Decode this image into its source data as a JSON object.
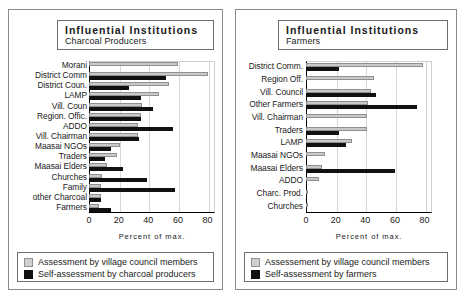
{
  "figure": {
    "background": "#ffffff",
    "series_colors": {
      "grey": "#c9c9c9",
      "black": "#111111"
    }
  },
  "panels": [
    {
      "id": "charcoal-producers",
      "title_main": "Influential Institutions",
      "title_sub": "Charcoal Producers",
      "xlabel": "Percent of max.",
      "xticks": [
        "0",
        "20",
        "40",
        "60",
        "80"
      ],
      "legend": [
        {
          "swatch": "grey",
          "label": "Assessment by village council members"
        },
        {
          "swatch": "black",
          "label": "Self-assessment by charcoal producers"
        }
      ],
      "chart_data": {
        "type": "bar",
        "orientation": "horizontal",
        "title": "Influential Institutions — Charcoal Producers",
        "xlabel": "Percent of max.",
        "ylabel": "",
        "xlim": [
          0,
          85
        ],
        "xticks": [
          0,
          20,
          40,
          60,
          80
        ],
        "grid": "vertical",
        "legend_position": "below-axes",
        "categories": [
          "Morani",
          "District Comm",
          "District Coun.",
          "LAMP",
          "Vill. Coun",
          "Region. Offic.",
          "ADDO",
          "Vill. Chairman",
          "Maasai NGOs",
          "Traders",
          "Maasai Elders",
          "Churches",
          "Family",
          "other Charcoal",
          "Farmers"
        ],
        "series": [
          {
            "name": "Assessment by village council members",
            "color": "#c9c9c9",
            "values": [
              60,
              80,
              54,
              47,
              36,
              35,
              33,
              33,
              21,
              19,
              12,
              9,
              8,
              8,
              7
            ]
          },
          {
            "name": "Self-assessment by charcoal producers",
            "color": "#111111",
            "values": [
              0,
              52,
              27,
              35,
              43,
              35,
              57,
              34,
              15,
              11,
              23,
              39,
              58,
              8,
              15
            ]
          }
        ]
      }
    },
    {
      "id": "farmers",
      "title_main": "Influential Institutions",
      "title_sub": "Farmers",
      "xlabel": "Percent of max.",
      "xticks": [
        "0",
        "20",
        "40",
        "60",
        "80"
      ],
      "legend": [
        {
          "swatch": "grey",
          "label": "Assessement by village council members"
        },
        {
          "swatch": "black",
          "label": "Self-assessment  by farmers"
        }
      ],
      "chart_data": {
        "type": "bar",
        "orientation": "horizontal",
        "title": "Influential Institutions — Farmers",
        "xlabel": "Percent of max.",
        "ylabel": "",
        "xlim": [
          0,
          85
        ],
        "xticks": [
          0,
          20,
          40,
          60,
          80
        ],
        "grid": "vertical",
        "legend_position": "below-axes",
        "categories": [
          "District Comm.",
          "Region Off.",
          "Vill. Council",
          "Other Farmers",
          "Vill. Chairman",
          "Traders",
          "LAMP",
          "Maasai NGOs",
          "Maasai Elders",
          "ADDO",
          "Charc. Prod.",
          "Churches"
        ],
        "series": [
          {
            "name": "Assessement by village council members",
            "color": "#c9c9c9",
            "values": [
              79,
              46,
              44,
              42,
              41,
              41,
              31,
              13,
              11,
              9,
              1,
              1
            ]
          },
          {
            "name": "Self-assessment  by farmers",
            "color": "#111111",
            "values": [
              22,
              1,
              47,
              75,
              0,
              22,
              27,
              0,
              60,
              0,
              1,
              1
            ]
          }
        ]
      }
    }
  ]
}
